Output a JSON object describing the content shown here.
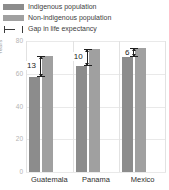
{
  "legend": {
    "items": [
      {
        "label": "Indigenous population",
        "icon": "square-swatch-icon",
        "color": "#8c8c8c"
      },
      {
        "label": "Non-indigenous population",
        "icon": "square-swatch-icon",
        "color": "#a0a0a0"
      },
      {
        "label": "Gap in life expectancy",
        "icon": "gap-range-icon",
        "color": "#3b3b3b"
      }
    ]
  },
  "chart_data": {
    "type": "bar",
    "title": "",
    "xlabel": "",
    "ylabel": "Years",
    "ylim": [
      0,
      80
    ],
    "yticks": [
      "80",
      "60",
      "40",
      "20",
      "0"
    ],
    "ytick_values": [
      80,
      60,
      40,
      20,
      0
    ],
    "grid": true,
    "legend_position": "top-left",
    "categories": [
      "Guatemala",
      "Panama",
      "Mexico"
    ],
    "series": [
      {
        "name": "Indigenous population",
        "values": [
          58,
          65,
          70
        ],
        "color": "#8c8c8c"
      },
      {
        "name": "Non-indigenous population",
        "values": [
          71,
          75,
          76
        ],
        "color": "#a0a0a0"
      }
    ],
    "annotations": [
      {
        "category": "Guatemala",
        "label": "13",
        "value": 13
      },
      {
        "category": "Panama",
        "label": "10",
        "value": 10
      },
      {
        "category": "Mexico",
        "label": "6",
        "value": 6
      }
    ]
  }
}
